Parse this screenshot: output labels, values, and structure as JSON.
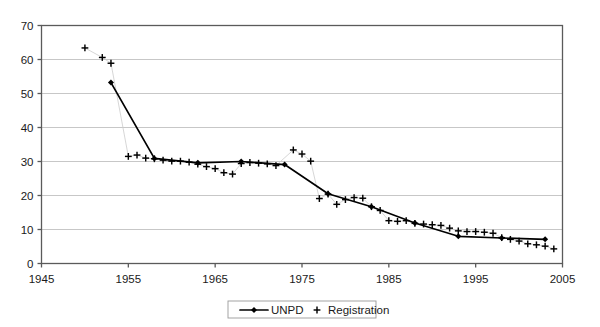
{
  "chart_data": {
    "type": "line",
    "title": "",
    "subtitle": "",
    "xlabel": "",
    "ylabel": "",
    "xlim": [
      1945,
      2005
    ],
    "ylim": [
      0,
      70
    ],
    "grid": true,
    "legend_position": "bottom-center",
    "x_ticks": [
      "1945",
      "1955",
      "1965",
      "1975",
      "1985",
      "1995",
      "2005"
    ],
    "x_tick_values": [
      1945,
      1955,
      1965,
      1975,
      1985,
      1995,
      2005
    ],
    "y_ticks": [
      "0",
      "10",
      "20",
      "30",
      "40",
      "50",
      "60",
      "70"
    ],
    "y_tick_values": [
      0,
      10,
      20,
      30,
      40,
      50,
      60,
      70
    ],
    "series": [
      {
        "name": "UNPD",
        "marker": "diamond",
        "line": true,
        "color": "#000000",
        "x": [
          1953,
          1958,
          1963,
          1968,
          1973,
          1978,
          1983,
          1988,
          1993,
          1998,
          2003
        ],
        "values": [
          53.2,
          30.9,
          29.6,
          30.0,
          29.1,
          20.5,
          16.7,
          11.9,
          8.0,
          7.5,
          7.1
        ]
      },
      {
        "name": "Registration",
        "marker": "plus",
        "line": false,
        "color": "#000000",
        "x": [
          1950,
          1952,
          1953,
          1955,
          1956,
          1957,
          1958,
          1959,
          1960,
          1961,
          1962,
          1963,
          1964,
          1965,
          1966,
          1967,
          1968,
          1969,
          1970,
          1971,
          1972,
          1974,
          1975,
          1976,
          1977,
          1978,
          1979,
          1980,
          1981,
          1982,
          1983,
          1984,
          1985,
          1986,
          1987,
          1988,
          1989,
          1990,
          1991,
          1992,
          1993,
          1994,
          1995,
          1996,
          1997,
          1998,
          1999,
          2000,
          2001,
          2002,
          2003,
          2004
        ],
        "values": [
          63.4,
          60.6,
          58.9,
          31.5,
          31.9,
          31.0,
          30.8,
          30.4,
          30.1,
          30.1,
          29.8,
          29.2,
          28.5,
          27.9,
          26.7,
          26.3,
          29.4,
          29.7,
          29.5,
          29.3,
          28.8,
          33.4,
          32.2,
          30.1,
          19.1,
          20.4,
          17.4,
          18.8,
          19.4,
          19.2,
          16.7,
          15.6,
          12.6,
          12.4,
          12.6,
          11.8,
          11.6,
          11.4,
          11.2,
          10.4,
          9.6,
          9.4,
          9.4,
          9.2,
          8.9,
          7.6,
          7.1,
          6.6,
          5.8,
          5.5,
          5.1,
          4.3
        ]
      }
    ]
  },
  "legend": {
    "entries": [
      {
        "label": "UNPD",
        "marker": "line-diamond"
      },
      {
        "label": "Registration",
        "marker": "plus"
      }
    ]
  },
  "colors": {
    "series": "#000000",
    "gridline": "#b9b9b9",
    "axis": "#5a5a5a",
    "background": "#ffffff",
    "text": "#1a1a1a"
  }
}
